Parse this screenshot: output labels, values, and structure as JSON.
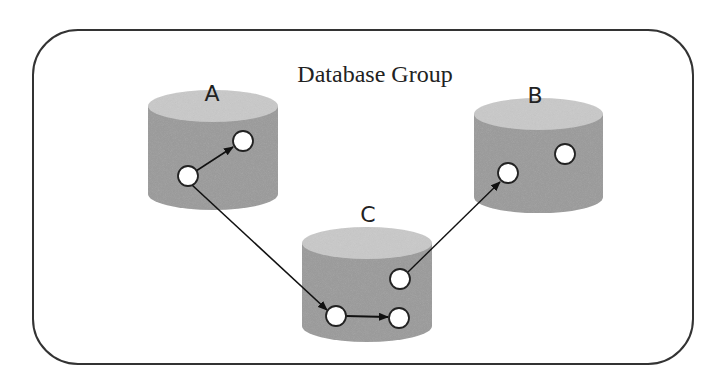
{
  "diagram": {
    "title": "Database Group",
    "colors": {
      "border": "#333333",
      "cylinder_body": "#9a9a9a",
      "cylinder_top": "#c9c9c9",
      "node_fill": "#ffffff",
      "node_stroke": "#222222",
      "arrow": "#111111"
    },
    "databases": [
      {
        "id": "A",
        "label": "A"
      },
      {
        "id": "B",
        "label": "B"
      },
      {
        "id": "C",
        "label": "C"
      }
    ],
    "edges": [
      {
        "from": "A.node1",
        "to": "A.node2"
      },
      {
        "from": "A.node1",
        "to": "C.node1"
      },
      {
        "from": "C.node1",
        "to": "C.node2"
      },
      {
        "from": "C.node3",
        "to": "B.node1"
      }
    ]
  }
}
